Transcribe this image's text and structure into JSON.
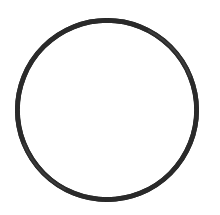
{
  "scene": {
    "subject_name": "rubber-o-ring",
    "description": "Black rubber O-ring gasket photographed on a plain white background",
    "canvas_width": 220,
    "canvas_height": 215,
    "background_color": "#ffffff"
  },
  "object": {
    "shape": "ring",
    "hollow": true,
    "center_x": 107,
    "center_y": 110,
    "outer_radius_x": 92,
    "outer_radius_y": 92,
    "cord_thickness_min": 3.2,
    "cord_thickness_max": 4.8,
    "cord_color": "#2a2a2a",
    "cord_color_light": "#4a4a4a",
    "edge_softness": 0.55,
    "bounds": {
      "left": 15,
      "top": 17,
      "right": 200,
      "bottom": 202
    }
  },
  "interior": {
    "fill_color": "#ffffff",
    "label": "hollow-center"
  }
}
